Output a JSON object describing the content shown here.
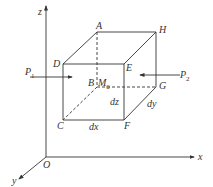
{
  "diagram": {
    "type": "3d-element-cube",
    "axes": {
      "x": "x",
      "y": "y",
      "z": "z",
      "origin": "O"
    },
    "vertices": {
      "A": "A",
      "B": "B",
      "C": "C",
      "D": "D",
      "E": "E",
      "F": "F",
      "G": "G",
      "H": "H"
    },
    "center_point": {
      "label": "M",
      "subscript": "0"
    },
    "forces": [
      {
        "label": "P",
        "subscript": "1",
        "direction": "right"
      },
      {
        "label": "P",
        "subscript": "2",
        "direction": "left"
      }
    ],
    "dimensions": {
      "dx": "dx",
      "dy": "dy",
      "dz": "dz"
    },
    "line_color": "#333333"
  }
}
